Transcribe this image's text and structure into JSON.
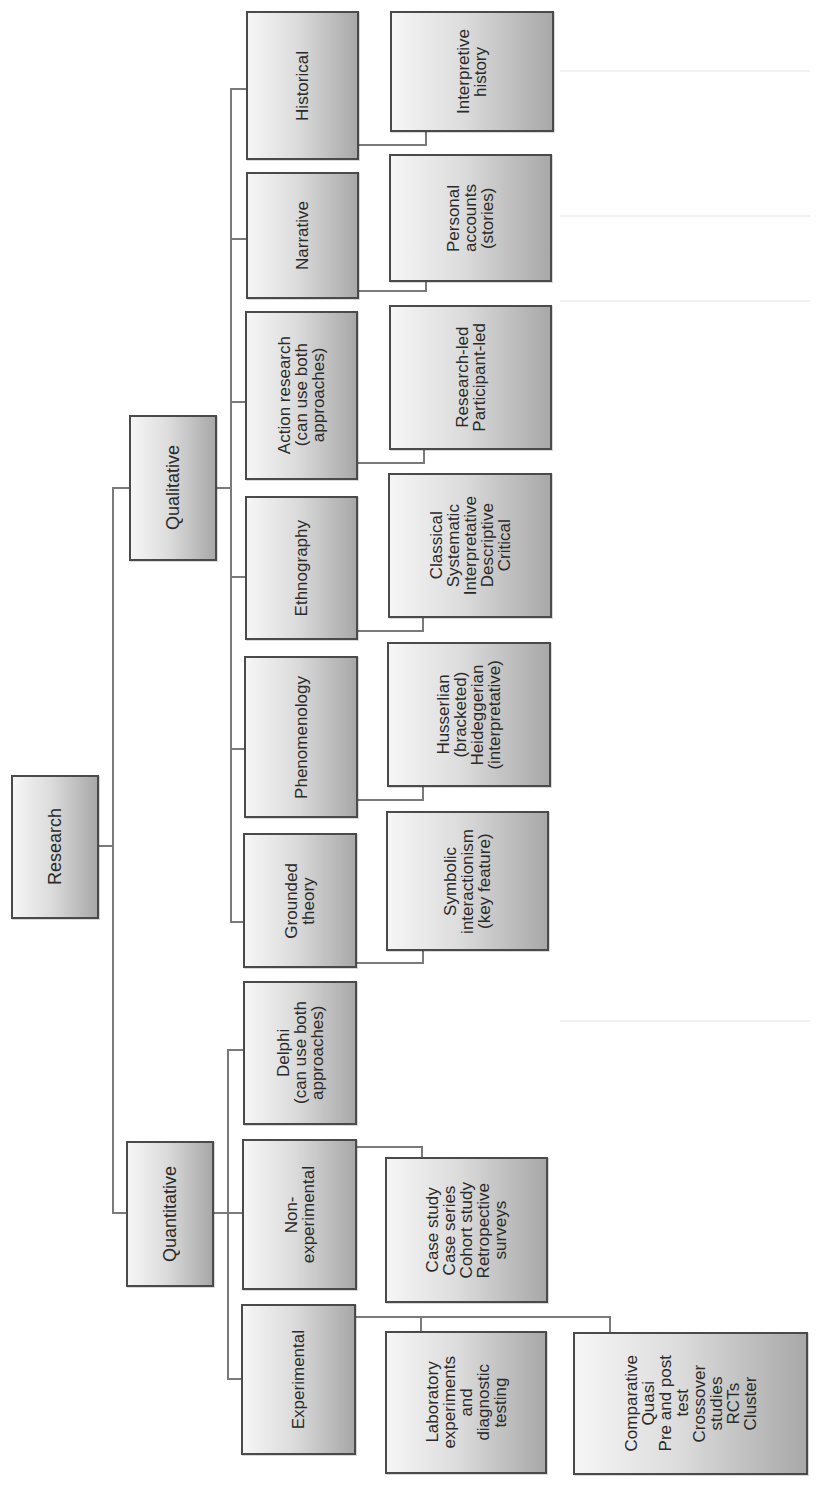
{
  "diagram": {
    "title": "Research",
    "root": {
      "label": "Research"
    },
    "branches": {
      "qualitative": {
        "label": "Qualitative",
        "children": {
          "historical": {
            "label": "Historical",
            "detail": "Interpretive\nhistory"
          },
          "narrative": {
            "label": "Narrative",
            "detail": "Personal\naccounts\n(stories)"
          },
          "action_research": {
            "label": "Action research\n(can use both\napproaches)",
            "detail": "Research-led\nParticipant-led"
          },
          "ethnography": {
            "label": "Ethnography",
            "detail": "Classical\nSystematic\nInterpretative\nDescriptive\nCritical"
          },
          "phenomenology": {
            "label": "Phenomenology",
            "detail": "Husserlian\n(bracketed)\nHeideggerian\n(interpretative)"
          },
          "grounded_theory": {
            "label": "Grounded\ntheory",
            "detail": "Symbolic\ninteractionism\n(key feature)"
          }
        }
      },
      "quantitative": {
        "label": "Quantitative",
        "children": {
          "delphi": {
            "label": "Delphi\n(can use both\napproaches)"
          },
          "non_experimental": {
            "label": "Non-\nexperimental",
            "detail": "Case study\nCase series\nCohort study\nRetropective\nsurveys"
          },
          "experimental": {
            "label": "Experimental",
            "details": [
              "Laboratory\nexperiments\nand\ndiagnostic\ntesting",
              "Comparative\nQuasi\nPre and post\ntest\nCrossover\nstudies\nRCTs\nCluster"
            ]
          }
        }
      }
    },
    "orientation": "rotated 90° counter-clockwise",
    "colors": {
      "box_border": "#4a4a4a",
      "box_gradient_light": "#f6f6f6",
      "box_gradient_dark": "#a8a8a8",
      "connector": "#7a7a7a",
      "text": "#2a2a2a"
    }
  }
}
